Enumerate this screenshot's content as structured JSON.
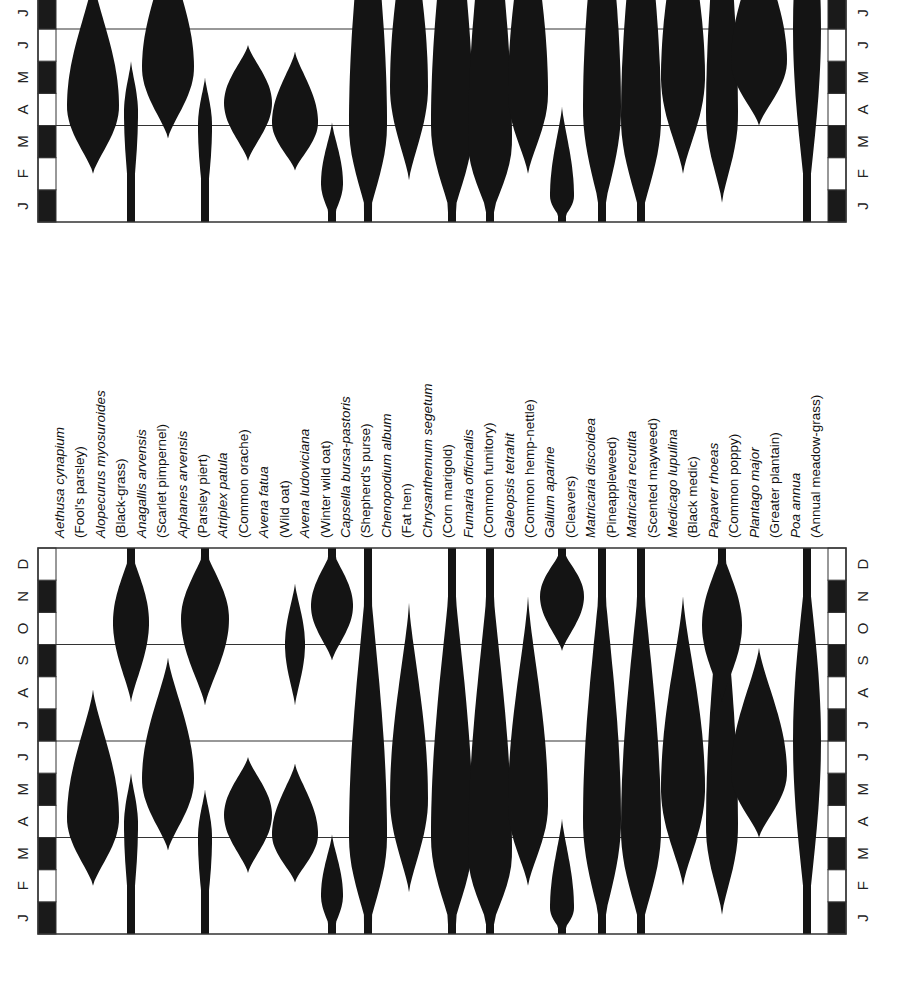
{
  "chart_data": {
    "type": "violin",
    "title": "",
    "xlabel": "",
    "ylabel": "",
    "months": [
      "J",
      "F",
      "M",
      "A",
      "M",
      "J",
      "J",
      "A",
      "S",
      "O",
      "N",
      "D"
    ],
    "reference_lines_after_month": [
      3,
      6,
      9
    ],
    "species": [
      {
        "scientific": "Aethusa cynapium",
        "common": "(Fool's parsley)"
      },
      {
        "scientific": "Alopecurus myosuroides",
        "common": "(Black-grass)"
      },
      {
        "scientific": "Anagallis arvensis",
        "common": "(Scarlet pimpernel)"
      },
      {
        "scientific": "Aphanes arvensis",
        "common": "(Parsley piert)"
      },
      {
        "scientific": "Atriplex patula",
        "common": "(Common orache)"
      },
      {
        "scientific": "Avena fatua",
        "common": "(Wild oat)"
      },
      {
        "scientific": "Avena ludoviciana",
        "common": "(Winter wild oat)"
      },
      {
        "scientific": "Capsella bursa-pastoris",
        "common": "(Shepherd's purse)"
      },
      {
        "scientific": "Chenopodium album",
        "common": "(Fat hen)"
      },
      {
        "scientific": "Chrysanthemum segetum",
        "common": "(Corn marigold)"
      },
      {
        "scientific": "Fumaria officinalis",
        "common": "(Common fumitory)"
      },
      {
        "scientific": "Galeopsis tetrahit",
        "common": "(Common hemp-nettle)"
      },
      {
        "scientific": "Galium aparine",
        "common": "(Cleavers)"
      },
      {
        "scientific": "Matricaria discoidea",
        "common": "(Pineappleweed)"
      },
      {
        "scientific": "Matricaria recutita",
        "common": "(Scented mayweed)"
      },
      {
        "scientific": "Medicago lupulina",
        "common": "(Black medic)"
      },
      {
        "scientific": "Papaver rhoeas",
        "common": "(Common poppy)"
      },
      {
        "scientific": "Plantago major",
        "common": "(Greater plantain)"
      },
      {
        "scientific": "Poa annua",
        "common": "(Annual meadow-grass)"
      }
    ],
    "emergence_spindles_bottom_panel": [
      {
        "species": "Aethusa cynapium",
        "x": 93,
        "shapes": [
          {
            "start": 1.5,
            "end": 7.6,
            "peak": 3.6,
            "halfwidth": 26
          }
        ]
      },
      {
        "species": "Alopecurus myosuroides",
        "x": 131,
        "shapes": [
          {
            "start": 0,
            "end": 5.0,
            "peak": 3.4,
            "halfwidth": 7
          },
          {
            "start": 7.2,
            "end": 12,
            "peak": 9.7,
            "halfwidth": 18
          }
        ]
      },
      {
        "species": "Anagallis arvensis",
        "x": 168,
        "shapes": [
          {
            "start": 2.6,
            "end": 8.6,
            "peak": 4.8,
            "halfwidth": 26
          }
        ]
      },
      {
        "species": "Aphanes arvensis",
        "x": 205,
        "shapes": [
          {
            "start": 0,
            "end": 4.5,
            "peak": 3.0,
            "halfwidth": 7
          },
          {
            "start": 7.1,
            "end": 12,
            "peak": 9.8,
            "halfwidth": 24
          }
        ]
      },
      {
        "species": "Atriplex patula",
        "x": 248,
        "shapes": [
          {
            "start": 1.9,
            "end": 5.5,
            "peak": 3.7,
            "halfwidth": 24
          }
        ]
      },
      {
        "species": "Avena fatua",
        "x": 295,
        "shapes": [
          {
            "start": 1.6,
            "end": 5.3,
            "peak": 3.1,
            "halfwidth": 23
          },
          {
            "start": 7.1,
            "end": 10.9,
            "peak": 9.0,
            "halfwidth": 10
          }
        ]
      },
      {
        "species": "Avena ludoviciana",
        "x": 332,
        "shapes": [
          {
            "start": 0,
            "end": 3.1,
            "peak": 1.2,
            "halfwidth": 11
          },
          {
            "start": 8.5,
            "end": 12,
            "peak": 10.2,
            "halfwidth": 21
          }
        ]
      },
      {
        "species": "Capsella bursa-pastoris",
        "x": 368,
        "shapes": [
          {
            "start": 0,
            "end": 12,
            "peak": 3.0,
            "halfwidth": 19
          }
        ]
      },
      {
        "species": "Chenopodium album",
        "x": 409,
        "shapes": [
          {
            "start": 1.3,
            "end": 10.3,
            "peak": 4.2,
            "halfwidth": 19
          }
        ]
      },
      {
        "species": "Chrysanthemum segetum",
        "x": 452,
        "shapes": [
          {
            "start": 0,
            "end": 12,
            "peak": 3.0,
            "halfwidth": 21
          }
        ]
      },
      {
        "species": "Fumaria officinalis",
        "x": 490,
        "shapes": [
          {
            "start": 0,
            "end": 12,
            "peak": 2.5,
            "halfwidth": 22
          }
        ]
      },
      {
        "species": "Galeopsis tetrahit",
        "x": 528,
        "shapes": [
          {
            "start": 1.5,
            "end": 10.5,
            "peak": 4.0,
            "halfwidth": 20
          }
        ]
      },
      {
        "species": "Galium aparine",
        "x": 562,
        "shapes": [
          {
            "start": 0,
            "end": 3.6,
            "peak": 0.8,
            "halfwidth": 12
          },
          {
            "start": 8.8,
            "end": 12,
            "peak": 10.5,
            "halfwidth": 22
          }
        ]
      },
      {
        "species": "Matricaria discoidea",
        "x": 602,
        "shapes": [
          {
            "start": 0,
            "end": 12,
            "peak": 3.5,
            "halfwidth": 19
          }
        ]
      },
      {
        "species": "Matricaria recutita",
        "x": 641,
        "shapes": [
          {
            "start": 0,
            "end": 12,
            "peak": 3.2,
            "halfwidth": 20
          }
        ]
      },
      {
        "species": "Medicago lupulina",
        "x": 683,
        "shapes": [
          {
            "start": 1.5,
            "end": 10.5,
            "peak": 4.5,
            "halfwidth": 22
          }
        ]
      },
      {
        "species": "Papaver rhoeas",
        "x": 722,
        "shapes": [
          {
            "start": 0.6,
            "end": 12,
            "peak": 3.3,
            "halfwidth": 16
          },
          {
            "start": 7.2,
            "end": 12,
            "peak": 9.6,
            "halfwidth": 20
          }
        ]
      },
      {
        "species": "Plantago major",
        "x": 759,
        "shapes": [
          {
            "start": 3.0,
            "end": 8.9,
            "peak": 5.0,
            "halfwidth": 28
          }
        ]
      },
      {
        "species": "Poa annua",
        "x": 807,
        "shapes": [
          {
            "start": 0,
            "end": 12,
            "peak": 6.0,
            "halfwidth": 14
          }
        ]
      }
    ]
  }
}
